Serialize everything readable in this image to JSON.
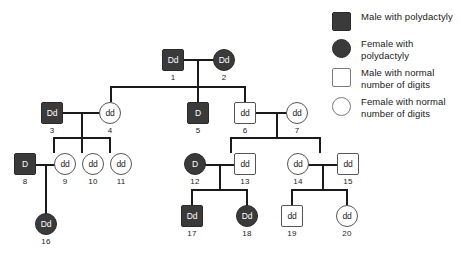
{
  "legend": {
    "items": [
      {
        "icon": "filled-square-icon",
        "shape": "male",
        "fill": "affected",
        "label": "Male with polydactyly"
      },
      {
        "icon": "filled-circle-icon",
        "shape": "female",
        "fill": "affected",
        "label": "Female with polydactyly"
      },
      {
        "icon": "open-square-icon",
        "shape": "male",
        "fill": "normal",
        "label": "Male with normal number of digits"
      },
      {
        "icon": "open-circle-icon",
        "shape": "female",
        "fill": "normal",
        "label": "Female with normal number of digits"
      }
    ]
  },
  "colors": {
    "affected_fill": "#3a3a3a",
    "normal_fill": "#ffffff",
    "line": "#1a1a1a",
    "text": "#1a1a1a",
    "background": "#ffffff"
  },
  "pedigree": {
    "individuals": [
      {
        "id": "1",
        "sex": "male",
        "status": "affected",
        "genotype": "Dd",
        "generation": 1
      },
      {
        "id": "2",
        "sex": "female",
        "status": "affected",
        "genotype": "Dd",
        "generation": 1
      },
      {
        "id": "3",
        "sex": "male",
        "status": "affected",
        "genotype": "Dd",
        "generation": 2
      },
      {
        "id": "4",
        "sex": "female",
        "status": "normal",
        "genotype": "dd",
        "generation": 2
      },
      {
        "id": "5",
        "sex": "male",
        "status": "affected",
        "genotype": "D",
        "generation": 2
      },
      {
        "id": "6",
        "sex": "male",
        "status": "normal",
        "genotype": "dd",
        "generation": 2
      },
      {
        "id": "7",
        "sex": "female",
        "status": "normal",
        "genotype": "dd",
        "generation": 2
      },
      {
        "id": "8",
        "sex": "male",
        "status": "affected",
        "genotype": "D",
        "generation": 3
      },
      {
        "id": "9",
        "sex": "female",
        "status": "normal",
        "genotype": "dd",
        "generation": 3
      },
      {
        "id": "10",
        "sex": "female",
        "status": "normal",
        "genotype": "dd",
        "generation": 3
      },
      {
        "id": "11",
        "sex": "female",
        "status": "normal",
        "genotype": "dd",
        "generation": 3
      },
      {
        "id": "12",
        "sex": "female",
        "status": "affected",
        "genotype": "D",
        "generation": 3
      },
      {
        "id": "13",
        "sex": "male",
        "status": "normal",
        "genotype": "dd",
        "generation": 3
      },
      {
        "id": "14",
        "sex": "female",
        "status": "normal",
        "genotype": "dd",
        "generation": 3
      },
      {
        "id": "15",
        "sex": "male",
        "status": "normal",
        "genotype": "dd",
        "generation": 3
      },
      {
        "id": "16",
        "sex": "female",
        "status": "affected",
        "genotype": "Dd",
        "generation": 4
      },
      {
        "id": "17",
        "sex": "male",
        "status": "affected",
        "genotype": "Dd",
        "generation": 4
      },
      {
        "id": "18",
        "sex": "female",
        "status": "affected",
        "genotype": "Dd",
        "generation": 4
      },
      {
        "id": "19",
        "sex": "male",
        "status": "normal",
        "genotype": "dd",
        "generation": 4
      },
      {
        "id": "20",
        "sex": "female",
        "status": "normal",
        "genotype": "dd",
        "generation": 4
      }
    ],
    "matings": [
      {
        "parents": [
          "1",
          "2"
        ],
        "children": [
          "4",
          "5",
          "6"
        ]
      },
      {
        "parents": [
          "3",
          "4"
        ],
        "children": [
          "9",
          "10",
          "11"
        ]
      },
      {
        "parents": [
          "6",
          "7"
        ],
        "children": [
          "13",
          "14"
        ]
      },
      {
        "parents": [
          "8",
          "9"
        ],
        "children": [
          "16"
        ]
      },
      {
        "parents": [
          "12",
          "13"
        ],
        "children": [
          "17",
          "18"
        ]
      },
      {
        "parents": [
          "14",
          "15"
        ],
        "children": [
          "19",
          "20"
        ]
      }
    ]
  }
}
